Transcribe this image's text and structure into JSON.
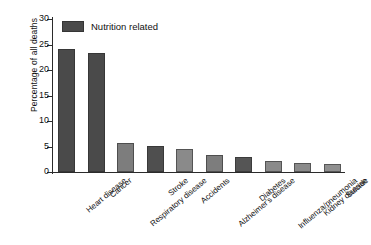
{
  "chart_data": {
    "type": "bar",
    "title": "",
    "xlabel": "",
    "ylabel": "Percentage of all deaths",
    "ylim": [
      0,
      30
    ],
    "yticks": [
      0,
      5,
      10,
      15,
      20,
      25,
      30
    ],
    "ytick_labels": [
      "0",
      "5",
      "10",
      "15",
      "20",
      "25",
      "30"
    ],
    "grid": false,
    "legend": {
      "position": "top-left-inside",
      "entries": [
        {
          "name": "Nutrition related",
          "color": "#4a4a4a"
        }
      ]
    },
    "categories": [
      "Heart disease",
      "Cancer",
      "Respiratory disease",
      "Stroke",
      "Accidents",
      "Alzheimer's disease",
      "Diabetes",
      "Influenza/pneumonia",
      "Kidney disease",
      "Suicide"
    ],
    "values": [
      24.1,
      23.3,
      5.6,
      5.1,
      4.6,
      3.4,
      2.9,
      2.1,
      1.8,
      1.5
    ],
    "nutrition_related": [
      true,
      true,
      false,
      true,
      false,
      false,
      true,
      false,
      false,
      false
    ],
    "bar_colors": [
      "#4a4a4a",
      "#4a4a4a",
      "#7d7d7d",
      "#4f4f4f",
      "#8a8a8a",
      "#7d7d7d",
      "#555555",
      "#8a8a8a",
      "#8a8a8a",
      "#8f8f8f"
    ],
    "colors": {
      "nutrition_related": "#4a4a4a",
      "other": "#8a8a8a",
      "axis": "#2b2b2b",
      "background": "#ffffff"
    }
  }
}
